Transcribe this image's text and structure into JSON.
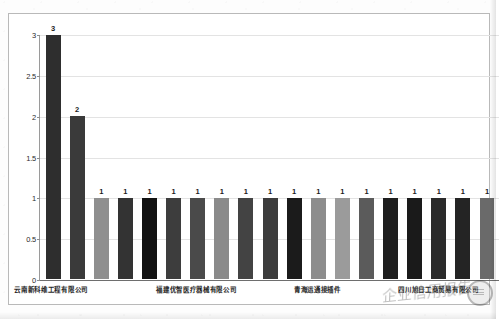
{
  "chart_data": {
    "type": "bar",
    "title": "",
    "subtitle": "",
    "xlabel": "",
    "ylabel": "",
    "ylim": [
      0,
      3
    ],
    "yticks": [
      "0",
      "0.5",
      "1",
      "1.5",
      "2",
      "2.5",
      "3"
    ],
    "ytick_values": [
      0,
      0.5,
      1,
      1.5,
      2,
      2.5,
      3
    ],
    "grid": true,
    "legend": "none",
    "categories": [
      "云南新科维工程有限公司",
      "",
      "",
      "",
      "",
      "",
      "福建优智医疗器械有限公司",
      "",
      "",
      "",
      "",
      "青海运通接插件",
      "",
      "",
      "",
      "",
      "四川旭日工商贸易有限公司",
      "",
      ""
    ],
    "visible_tick_labels": [
      {
        "text": "云南新科维工程有限公司",
        "bar_index": 0
      },
      {
        "text": "福建优智医疗器械有限公司",
        "bar_index": 6
      },
      {
        "text": "青海运通接插件",
        "bar_index": 11
      },
      {
        "text": "四川旭日工商贸易有限公司",
        "bar_index": 16
      }
    ],
    "values": [
      3,
      2,
      1,
      1,
      1,
      1,
      1,
      1,
      1,
      1,
      1,
      1,
      1,
      1,
      1,
      1,
      1,
      1,
      1
    ],
    "data_labels": [
      "3",
      "2",
      "1",
      "1",
      "1",
      "1",
      "1",
      "1",
      "1",
      "1",
      "1",
      "1",
      "1",
      "1",
      "1",
      "1",
      "1",
      "1",
      "1"
    ],
    "bar_colors": [
      "#2e2e2e",
      "#3a3a3a",
      "#8f8f8f",
      "#333333",
      "#121212",
      "#3d3d3d",
      "#4a4a4a",
      "#8a8a8a",
      "#434343",
      "#3c3c3c",
      "#1b1b1b",
      "#8d8d8d",
      "#9b9b9b",
      "#5b5b5b",
      "#1e1e1e",
      "#1a1a1a",
      "#2a2a2a",
      "#242424",
      "#6a6a6a"
    ],
    "bar_count": 19,
    "watermark": "企业信用报告"
  },
  "colors": {
    "plot_background": "#ffffff",
    "frame_border": "#b9b9b9",
    "gridline": "#e3e3e3",
    "axis_line": "#6e6e6e",
    "tick_text": "#2b2b2b",
    "label_text": "#1f1f1f"
  }
}
